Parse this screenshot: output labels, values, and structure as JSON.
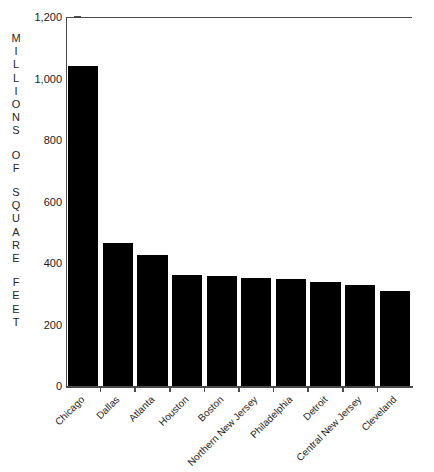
{
  "chart_data": {
    "type": "bar",
    "title": "",
    "xlabel": "",
    "ylabel": "MILLIONS OF SQUARE FEET",
    "ylabel_words": [
      "MILLIONS",
      "OF",
      "SQUARE",
      "FEET"
    ],
    "categories": [
      "Chicago",
      "Dallas",
      "Atlanta",
      "Houston",
      "Boston",
      "Northern New Jersey",
      "Philadelphia",
      "Detroit",
      "Central New Jersey",
      "Cleveland"
    ],
    "values": [
      1040,
      465,
      425,
      360,
      358,
      352,
      348,
      338,
      330,
      310
    ],
    "ylim": [
      0,
      1200
    ],
    "yticks": [
      0,
      200,
      400,
      600,
      800,
      1000,
      1200
    ],
    "ytick_labels": [
      "0",
      "200",
      "400",
      "600",
      "800",
      "1,000",
      "1,200"
    ],
    "grid": false,
    "legend": false,
    "bar_color": "#000000",
    "axis_color": "#4a4a4a",
    "background_color": "#ffffff"
  }
}
